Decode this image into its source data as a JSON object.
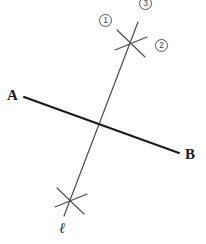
{
  "figure": {
    "type": "geometry-diagram",
    "width": 206,
    "height": 244,
    "background_color": "#ffffff"
  },
  "labels": {
    "point_a": "A",
    "point_b": "B",
    "line_l": "ℓ"
  },
  "circled_numbers": [
    {
      "id": "marker-1",
      "text": "①",
      "value": "1",
      "x": 99,
      "y": 14
    },
    {
      "id": "marker-2",
      "text": "②",
      "value": "2",
      "x": 155,
      "y": 39
    },
    {
      "id": "marker-3",
      "text": "③",
      "value": "3",
      "x": 139,
      "y": -3
    }
  ],
  "colors": {
    "line_ab": "#1a1a1a",
    "line_l": "#4a4a4a",
    "tick_mark": "#4a4a4a",
    "label_text": "#1a1a1a",
    "circle_stroke": "#555555"
  },
  "geometry": {
    "line_ab": {
      "name": "segment-ab",
      "x1": 24,
      "y1": 97,
      "x2": 179,
      "y2": 153,
      "stroke_width": 2.1
    },
    "line_l": {
      "name": "line-l",
      "x1": 138,
      "y1": 22,
      "x2": 64,
      "y2": 216,
      "stroke_width": 1.2
    },
    "intersection": {
      "x": 103,
      "y": 125
    },
    "tick_upper": {
      "name": "tick-mark-upper",
      "cx": 131,
      "cy": 43,
      "arms": [
        {
          "x1": 117,
          "y1": 30,
          "x2": 145,
          "y2": 57
        },
        {
          "x1": 115,
          "y1": 50,
          "x2": 147,
          "y2": 37
        }
      ]
    },
    "tick_lower": {
      "name": "tick-mark-lower",
      "cx": 70,
      "cy": 200,
      "arms": [
        {
          "x1": 57,
          "y1": 188,
          "x2": 84,
          "y2": 214
        },
        {
          "x1": 55,
          "y1": 207,
          "x2": 87,
          "y2": 194
        }
      ]
    }
  },
  "label_positions": {
    "point_a": {
      "x": 7,
      "y": 88
    },
    "point_b": {
      "x": 185,
      "y": 147
    },
    "line_l": {
      "x": 59,
      "y": 221
    }
  }
}
